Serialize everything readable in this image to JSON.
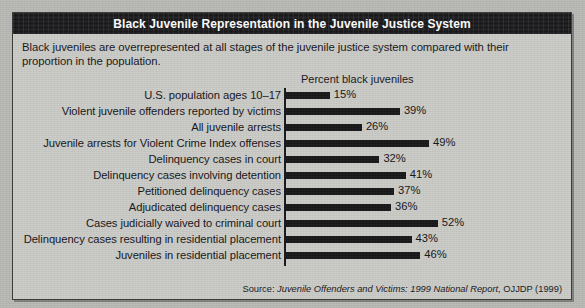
{
  "figure": {
    "title": "Black Juvenile Representation in the Juvenile Justice System",
    "intro": "Black juveniles are overrepresented at all stages of the juvenile justice system compared with their proportion in the population.",
    "axis_caption": "Percent black juveniles",
    "source_prefix": "Source: ",
    "source_italic": "Juvenile Offenders and Victims: 1999 National Report",
    "source_suffix": ", OJJDP (1999)"
  },
  "colors": {
    "title_band": "#17171a",
    "title_text": "#ffffff",
    "panel_background": "#cbcbc7",
    "bar": "#17171a",
    "text": "#16161a",
    "border": "#3a3a38"
  },
  "chart_data": {
    "type": "bar",
    "orientation": "horizontal",
    "title": "Black Juvenile Representation in the Juvenile Justice System",
    "subtitle": "Black juveniles are overrepresented at all stages of the juvenile justice system compared with their proportion in the population.",
    "xlabel": "Percent black juveniles",
    "ylabel": "",
    "xlim": [
      0,
      60
    ],
    "grid": false,
    "legend": false,
    "units": "percent",
    "categories": [
      "U.S. population ages 10–17",
      "Violent juvenile offenders reported by victims",
      "All juvenile arrests",
      "Juvenile arrests for Violent Crime Index offenses",
      "Delinquency cases in court",
      "Delinquency cases involving detention",
      "Petitioned delinquency cases",
      "Adjudicated delinquency cases",
      "Cases judicially waived to criminal court",
      "Delinquency cases resulting in residential placement",
      "Juveniles in residential placement"
    ],
    "values": [
      15,
      39,
      26,
      49,
      32,
      41,
      37,
      36,
      52,
      43,
      46
    ],
    "value_labels": [
      "15%",
      "39%",
      "26%",
      "49%",
      "32%",
      "41%",
      "37%",
      "36%",
      "52%",
      "43%",
      "46%"
    ],
    "source": "Source: Juvenile Offenders and Victims: 1999 National Report, OJJDP (1999)"
  }
}
